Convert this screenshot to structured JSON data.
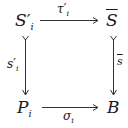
{
  "diagram": {
    "type": "commutative-square",
    "nodes": {
      "top_left": {
        "base": "S",
        "prime": "′",
        "sub": "i"
      },
      "top_right": {
        "base": "S",
        "overline": true
      },
      "bottom_left": {
        "base": "P",
        "sub": "i"
      },
      "bottom_right": {
        "base": "B"
      }
    },
    "arrows": {
      "top": {
        "from": "top_left",
        "to": "top_right",
        "label": {
          "base": "τ",
          "prime": "′",
          "sub": "i"
        },
        "label_position": "above"
      },
      "left": {
        "from": "top_left",
        "to": "bottom_left",
        "label": {
          "base": "s",
          "prime": "′",
          "sub": "i"
        },
        "label_position": "left",
        "tail": "mono"
      },
      "right": {
        "from": "top_right",
        "to": "bottom_right",
        "label": {
          "base": "s",
          "overline": true
        },
        "label_position": "right",
        "tail": "mono"
      },
      "bottom": {
        "from": "bottom_left",
        "to": "bottom_right",
        "label": {
          "base": "σ",
          "sub": "i"
        },
        "label_position": "below"
      }
    },
    "colors": {
      "ink": "#1a1a1a",
      "arrow": "#333333",
      "background": "#ffffff"
    }
  }
}
